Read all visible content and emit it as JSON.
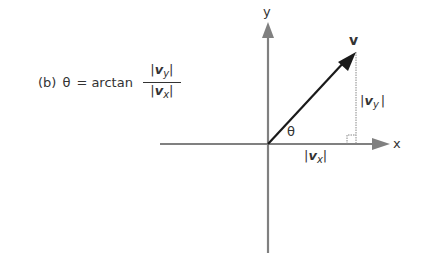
{
  "formula": {
    "part_label": "(b)",
    "theta": "θ",
    "equals_arctan": "= arctan",
    "numerator": {
      "bar_left": "|",
      "symbol": "v",
      "subscript": "y",
      "bar_right": "|"
    },
    "denominator": {
      "bar_left": "|",
      "symbol": "v",
      "subscript": "x",
      "bar_right": "|"
    }
  },
  "diagram": {
    "x_axis_label": "x",
    "y_axis_label": "y",
    "vector_label": "v",
    "angle_label": "θ",
    "vy_label": {
      "bar_left": "|",
      "symbol": "v",
      "subscript": "y",
      "bar_right": "|"
    },
    "vx_label": {
      "bar_left": "|",
      "symbol": "v",
      "subscript": "x",
      "bar_right": "|"
    },
    "colors": {
      "axis": "#808080",
      "vector": "#1a1a1a",
      "dashed": "#888888"
    }
  }
}
